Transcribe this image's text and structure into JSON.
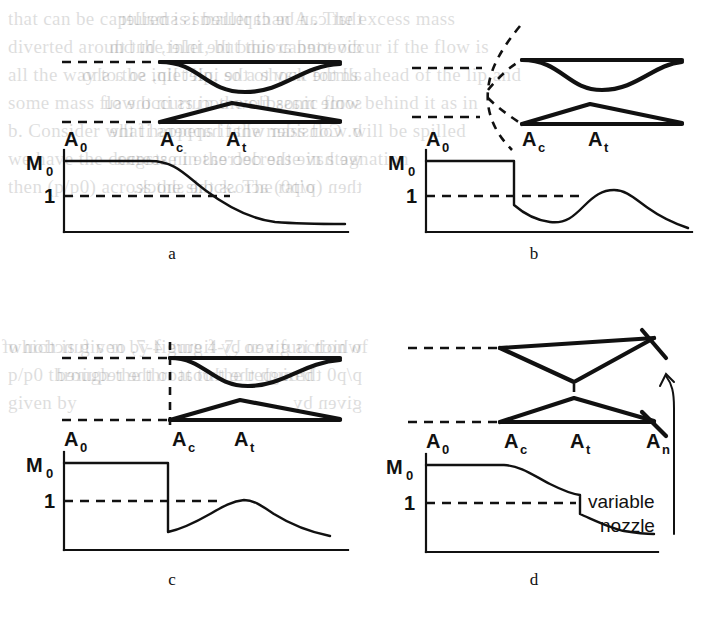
{
  "figure": {
    "panels": [
      {
        "id": "a",
        "letter": "a",
        "letter_pos": {
          "x": 172,
          "y": 236
        },
        "condition": "subcritical - shock swallowed, smooth deceleration downstream of cowl lip",
        "station_labels": [
          {
            "base": "A",
            "sub": "0",
            "x": 72,
            "y": 139
          },
          {
            "base": "A",
            "sub": "c",
            "x": 168,
            "y": 139
          },
          {
            "base": "A",
            "sub": "t",
            "x": 234,
            "y": 139
          }
        ],
        "y_axis_labels": [
          {
            "base": "M",
            "sub": "0",
            "x": 12,
            "y": 160
          },
          {
            "base": "1",
            "sub": "",
            "x": 26,
            "y": 196
          }
        ],
        "shock": {
          "type": "none"
        }
      },
      {
        "id": "b",
        "letter": "b",
        "letter_pos": {
          "x": 534,
          "y": 236
        },
        "condition": "supercritical - curved detached bow shock stands ahead of the inlet lip",
        "station_labels": [
          {
            "base": "A",
            "sub": "0",
            "x": 434,
            "y": 139
          },
          {
            "base": "A",
            "sub": "c",
            "x": 530,
            "y": 139
          },
          {
            "base": "A",
            "sub": "t",
            "x": 596,
            "y": 139
          }
        ],
        "y_axis_labels": [
          {
            "base": "M",
            "sub": "0",
            "x": 374,
            "y": 160
          },
          {
            "base": "1",
            "sub": "",
            "x": 388,
            "y": 196
          }
        ],
        "shock": {
          "type": "curved-detached-bow-shock"
        }
      },
      {
        "id": "c",
        "letter": "c",
        "letter_pos": {
          "x": 172,
          "y": 576
        },
        "condition": "critical - normal shock located exactly at the cowl lip station",
        "station_labels": [
          {
            "base": "A",
            "sub": "0",
            "x": 72,
            "y": 452
          },
          {
            "base": "A",
            "sub": "c",
            "x": 168,
            "y": 452
          },
          {
            "base": "A",
            "sub": "t",
            "x": 234,
            "y": 452
          }
        ],
        "y_axis_labels": [
          {
            "base": "M",
            "sub": "0",
            "x": 12,
            "y": 476
          },
          {
            "base": "1",
            "sub": "",
            "x": 26,
            "y": 512
          }
        ],
        "shock": {
          "type": "normal-shock-at-lip"
        }
      },
      {
        "id": "d",
        "letter": "d",
        "letter_pos": {
          "x": 534,
          "y": 576
        },
        "condition": "variable nozzle - shock positioned at the throat, exit area An set by movable flaps",
        "station_labels": [
          {
            "base": "A",
            "sub": "0",
            "x": 434,
            "y": 452
          },
          {
            "base": "A",
            "sub": "c",
            "x": 520,
            "y": 452
          },
          {
            "base": "A",
            "sub": "t",
            "x": 586,
            "y": 452
          },
          {
            "base": "A",
            "sub": "n",
            "x": 664,
            "y": 452
          }
        ],
        "y_axis_labels": [
          {
            "base": "M",
            "sub": "0",
            "x": 374,
            "y": 476
          },
          {
            "base": "1",
            "sub": "",
            "x": 388,
            "y": 512
          }
        ],
        "shock": {
          "type": "normal-shock-at-throat"
        },
        "annotation": {
          "line1": "variable",
          "line2": "nozzle",
          "x": 622,
          "y1": 500,
          "y2": 524
        }
      }
    ]
  },
  "chart_data": [
    {
      "type": "line",
      "title": "a",
      "xlabel": "",
      "ylabel": "M",
      "ylim": [
        0,
        1.6
      ],
      "xlim": [
        0,
        1
      ],
      "grid": false,
      "legend": null,
      "ytick_labels": [
        "1",
        "M_0"
      ],
      "ytick_values": [
        1.0,
        1.42
      ],
      "xtick_labels": [
        "A_0",
        "A_c",
        "A_t"
      ],
      "xtick_values": [
        0.16,
        0.52,
        0.76
      ],
      "annotations": [
        "free-stream Mach M_0 held to cowl lip, then isentropic deceleration through sonic to subsonic"
      ],
      "x": [
        0.02,
        0.2,
        0.4,
        0.52,
        0.6,
        0.68,
        0.76,
        0.84,
        0.92,
        1.0
      ],
      "values": [
        1.42,
        1.42,
        1.42,
        1.4,
        1.28,
        1.12,
        0.95,
        0.8,
        0.72,
        0.7
      ]
    },
    {
      "type": "line",
      "title": "b",
      "xlabel": "",
      "ylabel": "M",
      "ylim": [
        0,
        1.6
      ],
      "xlim": [
        0,
        1
      ],
      "grid": false,
      "legend": null,
      "ytick_labels": [
        "1",
        "M_0"
      ],
      "ytick_values": [
        1.0,
        1.42
      ],
      "xtick_labels": [
        "A_0",
        "A_c",
        "A_t"
      ],
      "xtick_values": [
        0.16,
        0.52,
        0.76
      ],
      "annotations": [
        "detached bow shock upstream of lip drops M below 1, flow re-accelerates to just above sonic at the throat, then decelerates"
      ],
      "x": [
        0.02,
        0.34,
        0.35,
        0.42,
        0.52,
        0.6,
        0.68,
        0.76,
        0.84,
        0.92,
        1.0
      ],
      "values": [
        1.42,
        1.42,
        0.86,
        0.72,
        0.62,
        0.78,
        0.95,
        1.06,
        1.0,
        0.88,
        0.78
      ]
    },
    {
      "type": "line",
      "title": "c",
      "xlabel": "",
      "ylabel": "M",
      "ylim": [
        0,
        1.6
      ],
      "xlim": [
        0,
        1
      ],
      "grid": false,
      "legend": null,
      "ytick_labels": [
        "1",
        "M_0"
      ],
      "ytick_values": [
        1.0,
        1.42
      ],
      "xtick_labels": [
        "A_0",
        "A_c",
        "A_t"
      ],
      "xtick_values": [
        0.16,
        0.52,
        0.76
      ],
      "annotations": [
        "normal shock sits at the cowl lip: discontinuous jump from M_0 to subsonic, then acceleration to sonic at throat"
      ],
      "x": [
        0.02,
        0.5,
        0.505,
        0.58,
        0.66,
        0.74,
        0.78,
        0.86,
        0.94,
        1.0
      ],
      "values": [
        1.42,
        1.42,
        0.56,
        0.68,
        0.82,
        0.98,
        1.0,
        0.86,
        0.74,
        0.68
      ]
    },
    {
      "type": "line",
      "title": "d",
      "xlabel": "",
      "ylabel": "M",
      "ylim": [
        0,
        1.6
      ],
      "xlim": [
        0,
        1
      ],
      "grid": false,
      "legend": null,
      "ytick_labels": [
        "1",
        "M_0"
      ],
      "ytick_values": [
        1.0,
        1.42
      ],
      "xtick_labels": [
        "A_0",
        "A_c",
        "A_t",
        "A_n"
      ],
      "xtick_values": [
        0.16,
        0.46,
        0.7,
        0.92
      ],
      "annotations": [
        "variable nozzle: gradual supersonic deceleration, normal shock swallowed to the throat station A_t"
      ],
      "x": [
        0.02,
        0.3,
        0.46,
        0.58,
        0.7,
        0.705,
        0.8,
        0.9,
        1.0
      ],
      "values": [
        1.42,
        1.42,
        1.4,
        1.26,
        1.14,
        0.88,
        0.76,
        0.7,
        0.68
      ]
    }
  ],
  "ghost_text": {
    "lines": [
      {
        "text": "that can be captured is smaller than A .  The excess mass",
        "x": 8,
        "y": 8,
        "flip": false
      },
      {
        "text": "that can be captured is smaller",
        "x": 362,
        "y": 8,
        "flip": true
      },
      {
        "text": "diverted around the inlet, but this cannot occur if the flow is",
        "x": 8,
        "y": 36,
        "flip": false
      },
      {
        "text": "diverted around the inlet, but th",
        "x": 362,
        "y": 36,
        "flip": true
      },
      {
        "text": "all the way to the inlet lip, so a shock forms ahead of the lip and",
        "x": 8,
        "y": 64,
        "flip": false
      },
      {
        "text": "all the way to the inlet lip, so a sho",
        "x": 362,
        "y": 64,
        "flip": true
      },
      {
        "text": "some mass flow occurs in the subsonic flow behind it as in",
        "x": 8,
        "y": 92,
        "flip": false
      },
      {
        "text": "some mass flow occurs in the su",
        "x": 362,
        "y": 92,
        "flip": true
      },
      {
        "text": "b.  Consider what happens if the mass flow will be spilled",
        "x": 8,
        "y": 120,
        "flip": false
      },
      {
        "text": "b.  Consider what happens if the",
        "x": 362,
        "y": 120,
        "flip": true
      },
      {
        "text": "we have the decrease in the decrease in stagnation",
        "x": 8,
        "y": 148,
        "flip": false
      },
      {
        "text": "we have the decrease in stagna",
        "x": 362,
        "y": 148,
        "flip": true
      },
      {
        "text": "then  (p/p0)  across the shock.  The ratio",
        "x": 8,
        "y": 176,
        "flip": false
      },
      {
        "text": "then  (p/p0)  across the shock.",
        "x": 362,
        "y": 176,
        "flip": true
      },
      {
        "text": "which is given by figure 4-7, or a function of",
        "x": 8,
        "y": 336,
        "flip": false
      },
      {
        "text": "which is given by figure 4-7, or a function of",
        "x": 362,
        "y": 336,
        "flip": true
      },
      {
        "text": "p/p0  through the throat to the required",
        "x": 8,
        "y": 364,
        "flip": false
      },
      {
        "text": "p/p0  through the throat to the required",
        "x": 362,
        "y": 364,
        "flip": true
      },
      {
        "text": "given by",
        "x": 8,
        "y": 392,
        "flip": false
      },
      {
        "text": "given by",
        "x": 362,
        "y": 392,
        "flip": true
      }
    ]
  }
}
